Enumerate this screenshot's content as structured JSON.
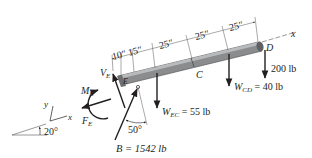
{
  "diagram": {
    "type": "free-body-diagram",
    "beam": {
      "color": "#8a8c8e",
      "end_cap_color": "#5e6063",
      "points": {
        "E": "E",
        "C": "C",
        "D": "D"
      }
    },
    "dimensions": [
      "10″",
      "15″",
      "25″",
      "25″",
      "25″"
    ],
    "axis_label_beam": "x",
    "forces": {
      "V_E": {
        "symbol": "V",
        "sub": "E"
      },
      "M_E": {
        "symbol": "M",
        "sub": "E"
      },
      "F_E": {
        "symbol": "F",
        "sub": "E"
      },
      "B": {
        "label": "B = 1542 lb",
        "angle": "50°"
      },
      "W_EC": {
        "symbol": "W",
        "sub": "EC",
        "value": " = 55 lb"
      },
      "W_CD": {
        "symbol": "W",
        "sub": "CD",
        "value": " = 40 lb"
      },
      "load_D": "200 lb"
    },
    "coordinate_axes": {
      "x": "x",
      "y": "y"
    },
    "incline_angle": "20°",
    "colors": {
      "ink": "#231f20",
      "beam": "#8a8c8e",
      "dim_line": "#555555"
    }
  }
}
